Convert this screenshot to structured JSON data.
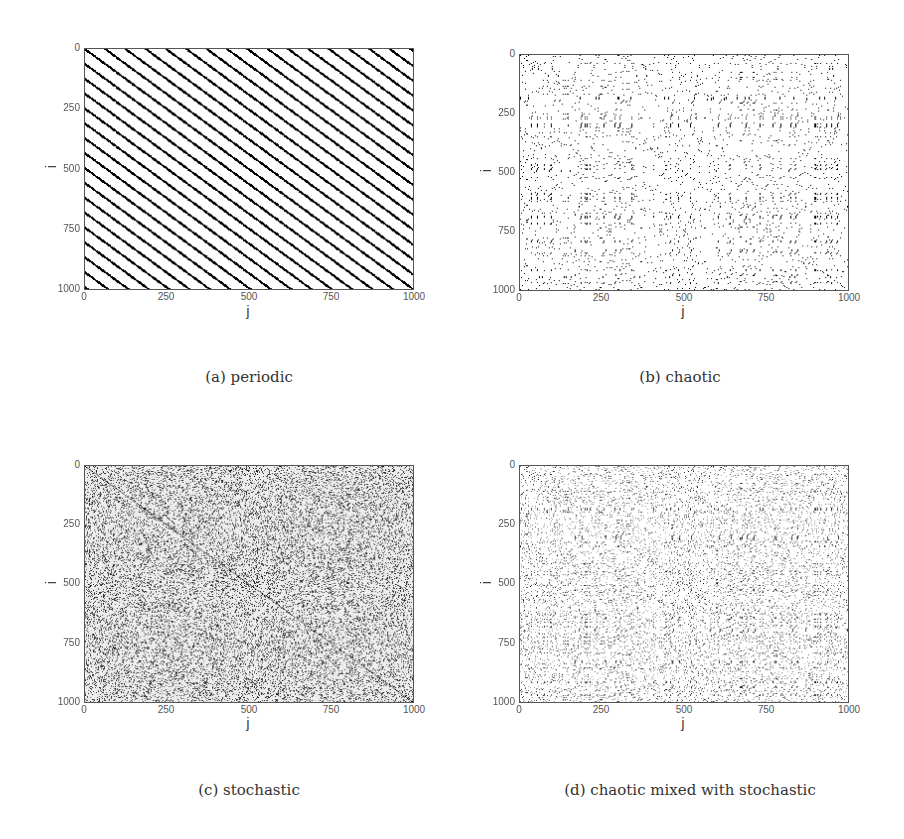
{
  "figure": {
    "panels": [
      {
        "id": "a",
        "caption": "(a) periodic",
        "xlabel": "j",
        "ylabel": "i",
        "xticks": [
          "0",
          "250",
          "500",
          "750",
          "1000"
        ],
        "yticks": [
          "0",
          "250",
          "500",
          "750",
          "1000"
        ],
        "type": "periodic"
      },
      {
        "id": "b",
        "caption": "(b) chaotic",
        "xlabel": "j",
        "ylabel": "i",
        "xticks": [
          "0",
          "250",
          "500",
          "750",
          "1000"
        ],
        "yticks": [
          "0",
          "250",
          "500",
          "750",
          "1000"
        ],
        "type": "chaotic"
      },
      {
        "id": "c",
        "caption": "(c) stochastic",
        "xlabel": "j",
        "ylabel": "i",
        "xticks": [
          "0",
          "250",
          "500",
          "750",
          "1000"
        ],
        "yticks": [
          "0",
          "250",
          "500",
          "750",
          "1000"
        ],
        "type": "stochastic"
      },
      {
        "id": "d",
        "caption": "(d) chaotic mixed with stochastic",
        "xlabel": "j",
        "ylabel": "i",
        "xticks": [
          "0",
          "250",
          "500",
          "750",
          "1000"
        ],
        "yticks": [
          "0",
          "250",
          "500",
          "750",
          "1000"
        ],
        "type": "chaotic+stochastic"
      }
    ]
  },
  "chart_data": [
    {
      "type": "heatmap",
      "title": "(a) periodic",
      "xlabel": "j",
      "ylabel": "i",
      "xlim": [
        0,
        1000
      ],
      "ylim": [
        0,
        1000
      ],
      "y_inverted": true,
      "xticks": [
        0,
        250,
        500,
        750,
        1000
      ],
      "yticks": [
        0,
        250,
        500,
        750,
        1000
      ],
      "description": "Recurrence plot: evenly spaced diagonal black lines parallel to the main diagonal",
      "period_estimate": 62,
      "line_count_estimate": 32
    },
    {
      "type": "heatmap",
      "title": "(b) chaotic",
      "xlabel": "j",
      "ylabel": "i",
      "xlim": [
        0,
        1000
      ],
      "ylim": [
        0,
        1000
      ],
      "y_inverted": true,
      "xticks": [
        0,
        250,
        500,
        750,
        1000
      ],
      "yticks": [
        0,
        250,
        500,
        750,
        1000
      ],
      "description": "Recurrence plot: short broken diagonal segments with blocky white gaps"
    },
    {
      "type": "heatmap",
      "title": "(c) stochastic",
      "xlabel": "j",
      "ylabel": "i",
      "xlim": [
        0,
        1000
      ],
      "ylim": [
        0,
        1000
      ],
      "y_inverted": true,
      "xticks": [
        0,
        250,
        500,
        750,
        1000
      ],
      "yticks": [
        0,
        250,
        500,
        750,
        1000
      ],
      "description": "Recurrence plot: homogeneous grey speckle noise with faint main diagonal"
    },
    {
      "type": "heatmap",
      "title": "(d) chaotic mixed with stochastic",
      "xlabel": "j",
      "ylabel": "i",
      "xlim": [
        0,
        1000
      ],
      "ylim": [
        0,
        1000
      ],
      "y_inverted": true,
      "xticks": [
        0,
        250,
        500,
        750,
        1000
      ],
      "yticks": [
        0,
        250,
        500,
        750,
        1000
      ],
      "description": "Recurrence plot: chaotic diagonal segments blurred with stochastic dots"
    }
  ]
}
